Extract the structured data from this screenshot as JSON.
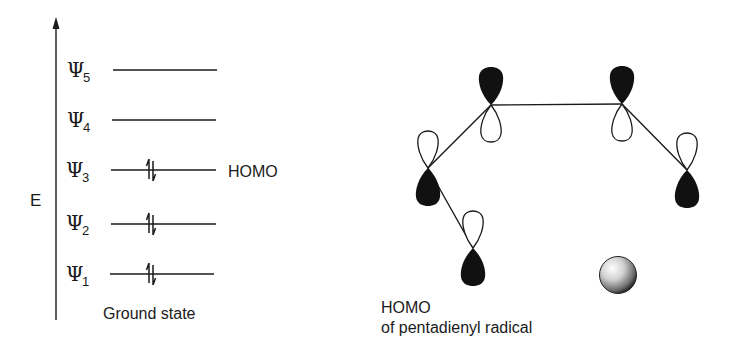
{
  "energy_diagram": {
    "axis_label": "E",
    "caption": "Ground state",
    "homo_label": "HOMO",
    "levels": [
      {
        "symbol": "Ψ",
        "sub": "5",
        "occupied": false
      },
      {
        "symbol": "Ψ",
        "sub": "4",
        "occupied": false
      },
      {
        "symbol": "Ψ",
        "sub": "3",
        "occupied": true,
        "is_homo": true
      },
      {
        "symbol": "Ψ",
        "sub": "2",
        "occupied": true
      },
      {
        "symbol": "Ψ",
        "sub": "1",
        "occupied": true
      }
    ]
  },
  "orbital_diagram": {
    "caption_line1": "HOMO",
    "caption_line2": "of pentadienyl radical",
    "lobe_colors": {
      "filled": "#111111",
      "empty": "#ffffff"
    }
  }
}
